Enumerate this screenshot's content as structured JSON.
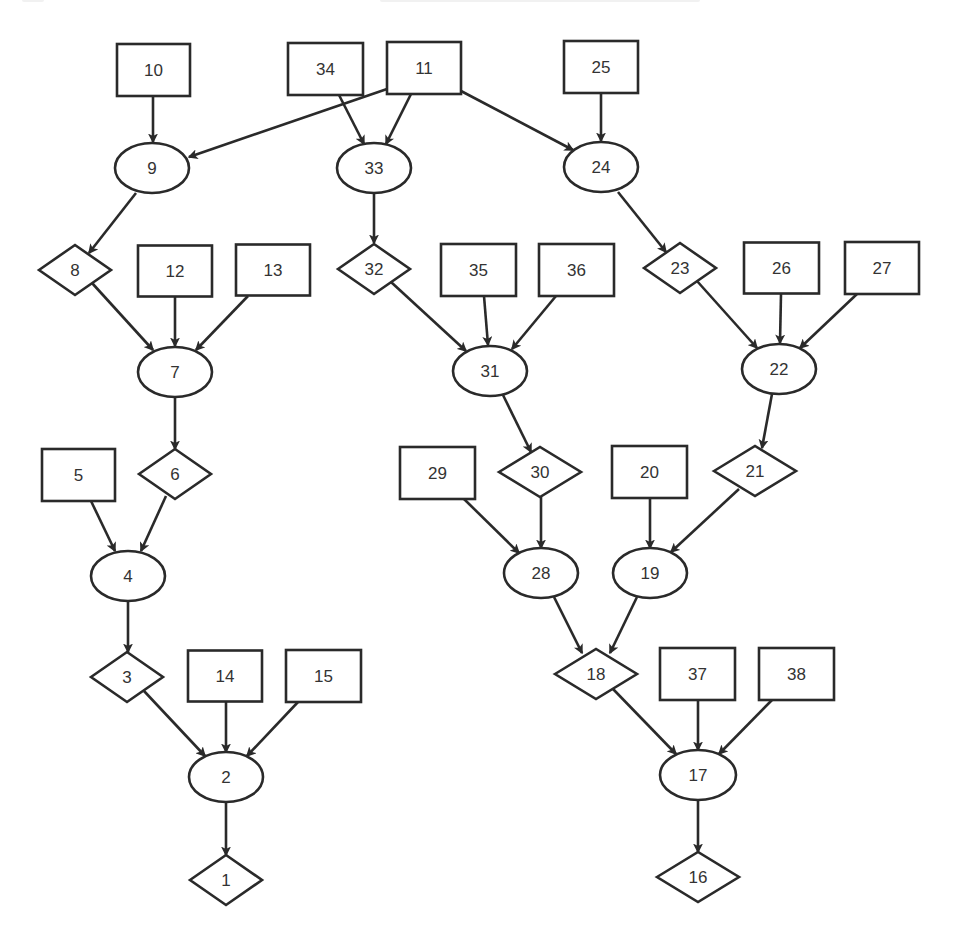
{
  "diagram": {
    "type": "directed-graph",
    "colors": {
      "stroke": "#2a2a2a",
      "fill": "#ffffff",
      "text": "#333333",
      "background": "#ffffff"
    },
    "shape_legend": {
      "rect": "leaf/input node",
      "ellipse": "intermediate node",
      "diamond": "decision/output node"
    },
    "nodes": [
      {
        "id": "10",
        "shape": "rect",
        "x": 153.5,
        "y": 70,
        "w": 73,
        "h": 52
      },
      {
        "id": "34",
        "shape": "rect",
        "x": 325.5,
        "y": 69,
        "w": 75,
        "h": 52
      },
      {
        "id": "11",
        "shape": "rect",
        "x": 424,
        "y": 68,
        "w": 74,
        "h": 52
      },
      {
        "id": "25",
        "shape": "rect",
        "x": 601,
        "y": 67,
        "w": 74,
        "h": 52
      },
      {
        "id": "9",
        "shape": "ellipse",
        "x": 152,
        "y": 168,
        "w": 74,
        "h": 50
      },
      {
        "id": "33",
        "shape": "ellipse",
        "x": 374,
        "y": 168,
        "w": 74,
        "h": 50
      },
      {
        "id": "24",
        "shape": "ellipse",
        "x": 601,
        "y": 167,
        "w": 74,
        "h": 50
      },
      {
        "id": "8",
        "shape": "diamond",
        "x": 75,
        "y": 270,
        "w": 72,
        "h": 50
      },
      {
        "id": "12",
        "shape": "rect",
        "x": 175,
        "y": 271,
        "w": 74,
        "h": 51
      },
      {
        "id": "13",
        "shape": "rect",
        "x": 273,
        "y": 270,
        "w": 74,
        "h": 51
      },
      {
        "id": "32",
        "shape": "diamond",
        "x": 374,
        "y": 269,
        "w": 72,
        "h": 50
      },
      {
        "id": "35",
        "shape": "rect",
        "x": 478.5,
        "y": 270,
        "w": 75,
        "h": 52
      },
      {
        "id": "36",
        "shape": "rect",
        "x": 576.5,
        "y": 270,
        "w": 75,
        "h": 52
      },
      {
        "id": "23",
        "shape": "diamond",
        "x": 680,
        "y": 268,
        "w": 72,
        "h": 50
      },
      {
        "id": "26",
        "shape": "rect",
        "x": 781.5,
        "y": 268,
        "w": 75,
        "h": 51
      },
      {
        "id": "27",
        "shape": "rect",
        "x": 882,
        "y": 268,
        "w": 74,
        "h": 52
      },
      {
        "id": "7",
        "shape": "ellipse",
        "x": 175,
        "y": 372,
        "w": 74,
        "h": 50
      },
      {
        "id": "31",
        "shape": "ellipse",
        "x": 490,
        "y": 371,
        "w": 74,
        "h": 50
      },
      {
        "id": "22",
        "shape": "ellipse",
        "x": 779,
        "y": 369,
        "w": 74,
        "h": 50
      },
      {
        "id": "5",
        "shape": "rect",
        "x": 78.5,
        "y": 475,
        "w": 73,
        "h": 52
      },
      {
        "id": "6",
        "shape": "diamond",
        "x": 175,
        "y": 474,
        "w": 72,
        "h": 50
      },
      {
        "id": "29",
        "shape": "rect",
        "x": 437.5,
        "y": 473,
        "w": 75,
        "h": 52
      },
      {
        "id": "30",
        "shape": "diamond",
        "x": 540,
        "y": 472,
        "w": 82,
        "h": 50
      },
      {
        "id": "20",
        "shape": "rect",
        "x": 649.5,
        "y": 472,
        "w": 75,
        "h": 52
      },
      {
        "id": "21",
        "shape": "diamond",
        "x": 755,
        "y": 471,
        "w": 82,
        "h": 50
      },
      {
        "id": "4",
        "shape": "ellipse",
        "x": 128,
        "y": 576,
        "w": 74,
        "h": 50
      },
      {
        "id": "28",
        "shape": "ellipse",
        "x": 541,
        "y": 573,
        "w": 74,
        "h": 50
      },
      {
        "id": "19",
        "shape": "ellipse",
        "x": 650,
        "y": 573,
        "w": 74,
        "h": 50
      },
      {
        "id": "3",
        "shape": "diamond",
        "x": 127,
        "y": 677,
        "w": 72,
        "h": 50
      },
      {
        "id": "14",
        "shape": "rect",
        "x": 225,
        "y": 676,
        "w": 74,
        "h": 51
      },
      {
        "id": "15",
        "shape": "rect",
        "x": 323.5,
        "y": 676,
        "w": 75,
        "h": 52
      },
      {
        "id": "18",
        "shape": "diamond",
        "x": 596,
        "y": 674,
        "w": 82,
        "h": 50
      },
      {
        "id": "37",
        "shape": "rect",
        "x": 697.5,
        "y": 674,
        "w": 75,
        "h": 52
      },
      {
        "id": "38",
        "shape": "rect",
        "x": 796.5,
        "y": 674,
        "w": 75,
        "h": 52
      },
      {
        "id": "2",
        "shape": "ellipse",
        "x": 226,
        "y": 777,
        "w": 74,
        "h": 50
      },
      {
        "id": "17",
        "shape": "ellipse",
        "x": 698,
        "y": 775,
        "w": 76,
        "h": 50
      },
      {
        "id": "1",
        "shape": "diamond",
        "x": 226,
        "y": 880,
        "w": 72,
        "h": 50
      },
      {
        "id": "16",
        "shape": "diamond",
        "x": 698,
        "y": 877,
        "w": 82,
        "h": 50
      }
    ],
    "edges": [
      {
        "from": "10",
        "to": "9",
        "x1": 153,
        "y1": 96,
        "x2": 153,
        "y2": 142
      },
      {
        "from": "11",
        "to": "9",
        "x1": 387,
        "y1": 89,
        "x2": 189,
        "y2": 157
      },
      {
        "from": "34",
        "to": "33",
        "x1": 339,
        "y1": 95,
        "x2": 364,
        "y2": 144
      },
      {
        "from": "11",
        "to": "33",
        "x1": 411,
        "y1": 94,
        "x2": 386,
        "y2": 144
      },
      {
        "from": "11",
        "to": "24",
        "x1": 461,
        "y1": 91,
        "x2": 573,
        "y2": 150
      },
      {
        "from": "25",
        "to": "24",
        "x1": 601,
        "y1": 93,
        "x2": 601,
        "y2": 141
      },
      {
        "from": "9",
        "to": "8",
        "x1": 136,
        "y1": 193,
        "x2": 89,
        "y2": 253
      },
      {
        "from": "33",
        "to": "32",
        "x1": 374,
        "y1": 193,
        "x2": 374,
        "y2": 243
      },
      {
        "from": "24",
        "to": "23",
        "x1": 618,
        "y1": 192,
        "x2": 666,
        "y2": 252
      },
      {
        "from": "8",
        "to": "7",
        "x1": 92,
        "y1": 283,
        "x2": 153,
        "y2": 350
      },
      {
        "from": "12",
        "to": "7",
        "x1": 175,
        "y1": 297,
        "x2": 175,
        "y2": 346
      },
      {
        "from": "13",
        "to": "7",
        "x1": 248,
        "y1": 296,
        "x2": 196,
        "y2": 350
      },
      {
        "from": "32",
        "to": "31",
        "x1": 391,
        "y1": 282,
        "x2": 466,
        "y2": 351
      },
      {
        "from": "35",
        "to": "31",
        "x1": 484,
        "y1": 296,
        "x2": 488,
        "y2": 345
      },
      {
        "from": "36",
        "to": "31",
        "x1": 556,
        "y1": 296,
        "x2": 512,
        "y2": 349
      },
      {
        "from": "23",
        "to": "22",
        "x1": 697,
        "y1": 281,
        "x2": 757,
        "y2": 348
      },
      {
        "from": "26",
        "to": "22",
        "x1": 781,
        "y1": 294,
        "x2": 780,
        "y2": 343
      },
      {
        "from": "27",
        "to": "22",
        "x1": 857,
        "y1": 294,
        "x2": 800,
        "y2": 348
      },
      {
        "from": "7",
        "to": "6",
        "x1": 175,
        "y1": 397,
        "x2": 175,
        "y2": 449
      },
      {
        "from": "31",
        "to": "30",
        "x1": 503,
        "y1": 395,
        "x2": 531,
        "y2": 452
      },
      {
        "from": "22",
        "to": "21",
        "x1": 772,
        "y1": 394,
        "x2": 762,
        "y2": 448
      },
      {
        "from": "5",
        "to": "4",
        "x1": 91,
        "y1": 501,
        "x2": 115,
        "y2": 551
      },
      {
        "from": "6",
        "to": "4",
        "x1": 166,
        "y1": 496,
        "x2": 141,
        "y2": 551
      },
      {
        "from": "29",
        "to": "28",
        "x1": 464,
        "y1": 499,
        "x2": 519,
        "y2": 553
      },
      {
        "from": "30",
        "to": "28",
        "x1": 541,
        "y1": 497,
        "x2": 541,
        "y2": 548
      },
      {
        "from": "20",
        "to": "19",
        "x1": 650,
        "y1": 498,
        "x2": 650,
        "y2": 548
      },
      {
        "from": "21",
        "to": "19",
        "x1": 739,
        "y1": 489,
        "x2": 671,
        "y2": 552
      },
      {
        "from": "4",
        "to": "3",
        "x1": 128,
        "y1": 601,
        "x2": 128,
        "y2": 652
      },
      {
        "from": "28",
        "to": "18",
        "x1": 554,
        "y1": 597,
        "x2": 582,
        "y2": 653
      },
      {
        "from": "19",
        "to": "18",
        "x1": 637,
        "y1": 597,
        "x2": 610,
        "y2": 653
      },
      {
        "from": "3",
        "to": "2",
        "x1": 144,
        "y1": 691,
        "x2": 205,
        "y2": 756
      },
      {
        "from": "14",
        "to": "2",
        "x1": 226,
        "y1": 702,
        "x2": 226,
        "y2": 752
      },
      {
        "from": "15",
        "to": "2",
        "x1": 298,
        "y1": 702,
        "x2": 247,
        "y2": 756
      },
      {
        "from": "18",
        "to": "17",
        "x1": 613,
        "y1": 689,
        "x2": 676,
        "y2": 754
      },
      {
        "from": "37",
        "to": "17",
        "x1": 698,
        "y1": 700,
        "x2": 698,
        "y2": 750
      },
      {
        "from": "38",
        "to": "17",
        "x1": 772,
        "y1": 700,
        "x2": 719,
        "y2": 754
      },
      {
        "from": "2",
        "to": "1",
        "x1": 226,
        "y1": 802,
        "x2": 226,
        "y2": 855
      },
      {
        "from": "17",
        "to": "16",
        "x1": 698,
        "y1": 800,
        "x2": 698,
        "y2": 852
      }
    ]
  }
}
